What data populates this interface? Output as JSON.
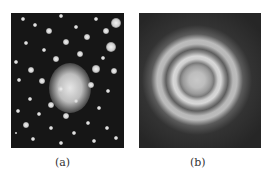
{
  "figure": {
    "panels": [
      {
        "id": "a",
        "label": "(a)",
        "description": "Spot diffraction pattern (single crystal)"
      },
      {
        "id": "b",
        "label": "(b)",
        "description": "Ring diffraction pattern (polycrystalline)"
      }
    ]
  }
}
